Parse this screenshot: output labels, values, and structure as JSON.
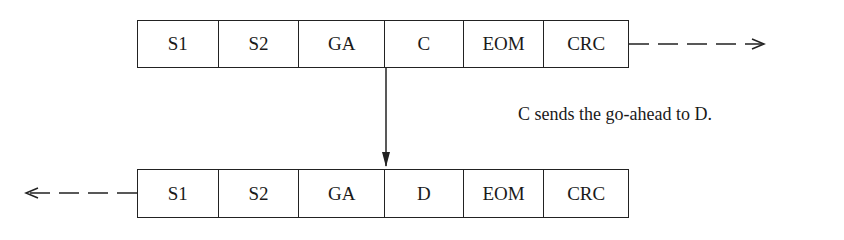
{
  "diagram": {
    "top_frame": {
      "fields": [
        {
          "label": "S1",
          "width": 81
        },
        {
          "label": "S2",
          "width": 81
        },
        {
          "label": "GA",
          "width": 86
        },
        {
          "label": "C",
          "width": 79
        },
        {
          "label": "EOM",
          "width": 81
        },
        {
          "label": "CRC",
          "width": 84
        }
      ],
      "arrow_direction": "right",
      "arrow_style": "dashed"
    },
    "bottom_frame": {
      "fields": [
        {
          "label": "S1",
          "width": 81
        },
        {
          "label": "S2",
          "width": 81
        },
        {
          "label": "GA",
          "width": 86
        },
        {
          "label": "D",
          "width": 79
        },
        {
          "label": "EOM",
          "width": 81
        },
        {
          "label": "CRC",
          "width": 84
        }
      ],
      "arrow_direction": "left",
      "arrow_style": "dashed"
    },
    "connector": {
      "from": "top_frame.C",
      "to": "bottom_frame.D",
      "direction": "down"
    },
    "caption": "C sends the go-ahead to D.",
    "colors": {
      "stroke": "#222222",
      "text": "#1a1a1a",
      "background": "#ffffff"
    }
  }
}
